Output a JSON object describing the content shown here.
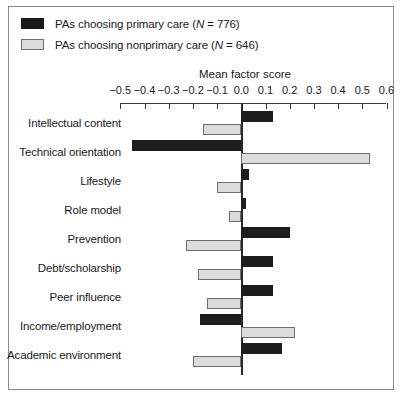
{
  "chart_data": {
    "type": "bar",
    "orientation": "horizontal",
    "title": "",
    "xlabel": "Mean factor score",
    "ylabel": "",
    "xlim": [
      -0.5,
      0.6
    ],
    "xticks": [
      -0.5,
      -0.4,
      -0.3,
      -0.2,
      -0.1,
      0.0,
      0.1,
      0.2,
      0.3,
      0.4,
      0.5,
      0.6
    ],
    "xticklabels": [
      "−0.5",
      "−0.4",
      "−0.3",
      "−0.2",
      "−0.1",
      "0.0",
      "0.1",
      "0.2",
      "0.3",
      "0.4",
      "0.5",
      "0.6"
    ],
    "grid": false,
    "legend_position": "top-left",
    "categories": [
      "Intellectual content",
      "Technical orientation",
      "Lifestyle",
      "Role model",
      "Prevention",
      "Debt/scholarship",
      "Peer influence",
      "Income/employment",
      "Academic environment"
    ],
    "series": [
      {
        "name": "PAs choosing primary care (N = 776)",
        "color": "#1d1d1d",
        "values": [
          0.13,
          -0.45,
          0.03,
          0.02,
          0.2,
          0.13,
          0.13,
          -0.17,
          0.17
        ]
      },
      {
        "name": "PAs choosing nonprimary care (N = 646)",
        "color": "#dcdcdc",
        "values": [
          -0.16,
          0.53,
          -0.1,
          -0.05,
          -0.23,
          -0.18,
          -0.14,
          0.22,
          -0.2
        ]
      }
    ]
  },
  "legend": {
    "items": [
      {
        "label_main": "PAs choosing primary care (",
        "label_ital": "N",
        "label_tail": " = 776)"
      },
      {
        "label_main": "PAs choosing nonprimary care (",
        "label_ital": "N",
        "label_tail": " = 646)"
      }
    ]
  }
}
